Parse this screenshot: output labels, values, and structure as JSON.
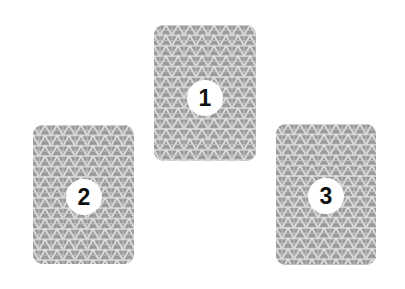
{
  "cards": [
    {
      "label": "1",
      "position": "top-center"
    },
    {
      "label": "2",
      "position": "bottom-left"
    },
    {
      "label": "3",
      "position": "bottom-right"
    }
  ],
  "colors": {
    "card_fill": "#9a9a9a",
    "pattern_lines": "#e6e6e6",
    "badge_fill": "#ffffff",
    "badge_text": "#111111",
    "background": "#ffffff"
  }
}
